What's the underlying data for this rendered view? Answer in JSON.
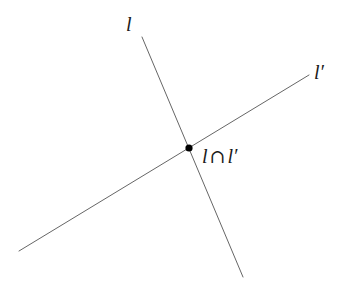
{
  "figure": {
    "type": "geometry-diagram",
    "canvas": {
      "width": 347,
      "height": 291,
      "background": "#ffffff"
    },
    "style": {
      "line_color": "#666666",
      "line_width": 1,
      "point_color": "#000000",
      "label_color": "#1a1a1a"
    },
    "lines": [
      {
        "id": "line-l",
        "label": "l",
        "x1": 142,
        "y1": 37,
        "x2": 243,
        "y2": 277,
        "label_x": 126,
        "label_y": 14
      },
      {
        "id": "line-l-prime",
        "label_base": "l",
        "label_prime": "′",
        "label": "l′",
        "x1": 19,
        "y1": 251,
        "x2": 309,
        "y2": 75,
        "label_x": 314,
        "label_y": 62
      }
    ],
    "points": [
      {
        "id": "intersection-point",
        "x": 189,
        "y": 148,
        "radius": 3.6,
        "label_left": "l",
        "label_operator": "∩",
        "label_right": "l′",
        "label_full": "l ∩ l′",
        "label_x": 202,
        "label_y": 146
      }
    ]
  }
}
